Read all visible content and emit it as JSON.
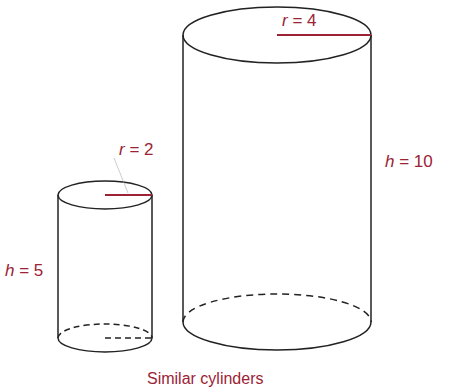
{
  "diagram": {
    "small_cylinder": {
      "radius_label": {
        "var": "r",
        "text": " = 2"
      },
      "height_label": {
        "var": "h",
        "text": " = 5"
      }
    },
    "large_cylinder": {
      "radius_label": {
        "var": "r",
        "text": " = 4"
      },
      "height_label": {
        "var": "h",
        "text": " = 10"
      }
    },
    "caption": "Similar cylinders",
    "colors": {
      "label": "#9b2335",
      "outline": "#222222"
    }
  }
}
